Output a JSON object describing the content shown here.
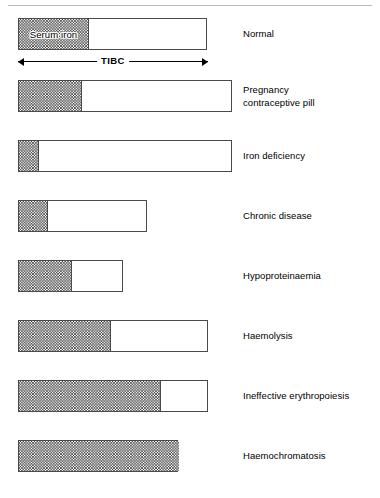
{
  "figure": {
    "serum_iron_caption": "Serum iron",
    "tibc_caption": "TIBC",
    "rule_color": "#b9b9b9",
    "bar_border_color": "#4a4a4a",
    "hatch_color": "#282828"
  },
  "chart_data": {
    "type": "bar",
    "title": "",
    "xlabel": "",
    "ylabel": "",
    "legend": [
      "Serum iron (hatched)",
      "Unsaturated binding capacity (white)"
    ],
    "annotations": [
      "Serum iron",
      "TIBC"
    ],
    "axis_note": "Bar total length = TIBC (total iron binding capacity); hatched portion = serum iron",
    "categories": [
      "Normal",
      "Pregnancy\ncontraceptive pill",
      "Iron deficiency",
      "Chronic disease",
      "Hypoproteinaemia",
      "Haemolysis",
      "Ineffective erythropoiesis",
      "Haemochromatosis"
    ],
    "series": [
      {
        "name": "Serum iron",
        "values": [
          70,
          63,
          20,
          29,
          53,
          92,
          142,
          160
        ]
      },
      {
        "name": "TIBC",
        "values": [
          189,
          214,
          214,
          129,
          105,
          190,
          190,
          160
        ]
      }
    ]
  },
  "rows": [
    {
      "label": "Normal",
      "bar_left": 18,
      "bar_top": 18,
      "bar_width": 189,
      "fill_width": 70,
      "full": false,
      "show_serum_label": true,
      "label_top": 28
    },
    {
      "label": "Pregnancy\ncontraceptive pill",
      "bar_left": 18,
      "bar_top": 80,
      "bar_width": 214,
      "fill_width": 63,
      "full": false,
      "show_serum_label": false,
      "label_top": 84
    },
    {
      "label": "Iron deficiency",
      "bar_left": 18,
      "bar_top": 140,
      "bar_width": 214,
      "fill_width": 20,
      "full": false,
      "show_serum_label": false,
      "label_top": 150
    },
    {
      "label": "Chronic disease",
      "bar_left": 18,
      "bar_top": 200,
      "bar_width": 129,
      "fill_width": 29,
      "full": false,
      "show_serum_label": false,
      "label_top": 210
    },
    {
      "label": "Hypoproteinaemia",
      "bar_left": 18,
      "bar_top": 260,
      "bar_width": 105,
      "fill_width": 53,
      "full": false,
      "show_serum_label": false,
      "label_top": 270
    },
    {
      "label": "Haemolysis",
      "bar_left": 18,
      "bar_top": 320,
      "bar_width": 190,
      "fill_width": 92,
      "full": false,
      "show_serum_label": false,
      "label_top": 330
    },
    {
      "label": "Ineffective erythropoiesis",
      "bar_left": 18,
      "bar_top": 380,
      "bar_width": 190,
      "fill_width": 142,
      "full": false,
      "show_serum_label": false,
      "label_top": 390
    },
    {
      "label": "Haemochromatosis",
      "bar_left": 18,
      "bar_top": 440,
      "bar_width": 160,
      "fill_width": 160,
      "full": true,
      "show_serum_label": false,
      "label_top": 450
    }
  ]
}
